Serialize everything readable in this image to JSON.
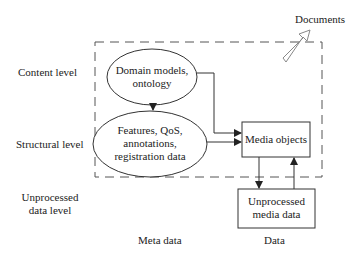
{
  "diagram": {
    "levels": {
      "content": "Content level",
      "structural": "Structural level",
      "unprocessed_line1": "Unprocessed",
      "unprocessed_line2": "data level"
    },
    "columns": {
      "meta": "Meta data",
      "data": "Data"
    },
    "documents_label": "Documents",
    "nodes": {
      "domain_models": {
        "line1": "Domain models,",
        "line2": "ontology"
      },
      "features": {
        "line1": "Features, QoS,",
        "line2": "annotations,",
        "line3": "registration data"
      },
      "media_objects": {
        "line1": "Media objects"
      },
      "unprocessed_media": {
        "line1": "Unprocessed",
        "line2": "media data"
      }
    },
    "colors": {
      "line": "#333333",
      "dash": "#555555",
      "arrow_outline": "#777777"
    }
  }
}
